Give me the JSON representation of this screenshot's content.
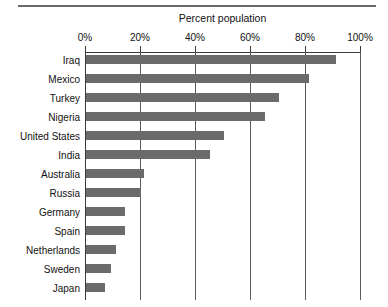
{
  "chart_data": {
    "type": "bar",
    "orientation": "horizontal",
    "title": "Percent population",
    "xlabel": "",
    "ylabel": "",
    "xlim": [
      0,
      100
    ],
    "xtick_labels": [
      "0%",
      "20%",
      "40%",
      "60%",
      "80%",
      "100%"
    ],
    "xtick_values": [
      0,
      20,
      40,
      60,
      80,
      100
    ],
    "grid": "vertical",
    "legend": "none",
    "bar_color": "#6b6b6b",
    "categories": [
      "Iraq",
      "Mexico",
      "Turkey",
      "Nigeria",
      "United States",
      "India",
      "Australia",
      "Russia",
      "Germany",
      "Spain",
      "Netherlands",
      "Sweden",
      "Japan"
    ],
    "values": [
      91,
      81,
      70,
      65,
      50,
      45,
      21,
      20,
      14,
      14,
      11,
      9,
      7
    ],
    "series": [
      {
        "name": "Percent population",
        "values": [
          91,
          81,
          70,
          65,
          50,
          45,
          21,
          20,
          14,
          14,
          11,
          9,
          7
        ]
      }
    ]
  },
  "figure": {
    "has_top_rule": true,
    "background": "#ffffff",
    "axis_color": "#3a3a3a",
    "gridline_color": "#5a5a5a"
  }
}
